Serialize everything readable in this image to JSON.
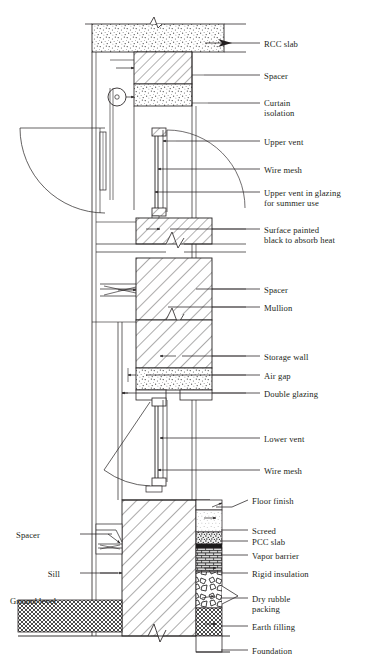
{
  "drawing": {
    "title": "Trombe wall vertical section detail",
    "type": "architectural-section",
    "line_color": "#231f20",
    "background": "#ffffff"
  },
  "labels_right": [
    {
      "id": "rcc-slab",
      "text": "RCC slab",
      "x": 264,
      "y": 39,
      "leader_from_x": 232,
      "leader_from_y": 43,
      "leader_to_x": 260,
      "leader_to_y": 43,
      "lines": 1
    },
    {
      "id": "spacer-top",
      "text": "Spacer",
      "x": 264,
      "y": 71,
      "leader_from_x": 204,
      "leader_from_y": 75,
      "leader_to_x": 260,
      "leader_to_y": 75,
      "lines": 1
    },
    {
      "id": "curtain-isolation",
      "text": "Curtain\nisolation",
      "x": 264,
      "y": 98,
      "leader_from_x": 208,
      "leader_from_y": 103,
      "leader_to_x": 260,
      "leader_to_y": 103,
      "lines": 2
    },
    {
      "id": "upper-vent",
      "text": "Upper vent",
      "x": 264,
      "y": 137,
      "leader_from_x": 176,
      "leader_from_y": 141,
      "leader_to_x": 260,
      "leader_to_y": 141,
      "lines": 1
    },
    {
      "id": "wire-mesh-upper",
      "text": "Wire mesh",
      "x": 264,
      "y": 165,
      "leader_from_x": 168,
      "leader_from_y": 169,
      "leader_to_x": 260,
      "leader_to_y": 169,
      "lines": 1
    },
    {
      "id": "upper-vent-glazing",
      "text": "Upper vent in glazing\nfor summer use",
      "x": 264,
      "y": 188,
      "leader_from_x": 160,
      "leader_from_y": 192,
      "leader_to_x": 260,
      "leader_to_y": 192,
      "lines": 2
    },
    {
      "id": "surface-painted",
      "text": "Surface painted\nblack to absorb heat",
      "x": 264,
      "y": 225,
      "leader_from_x": 170,
      "leader_from_y": 229,
      "leader_to_x": 260,
      "leader_to_y": 229,
      "lines": 2
    },
    {
      "id": "spacer-mid",
      "text": "Spacer",
      "x": 264,
      "y": 285,
      "leader_from_x": 196,
      "leader_from_y": 289,
      "leader_to_x": 260,
      "leader_to_y": 289,
      "lines": 1
    },
    {
      "id": "mullion",
      "text": "Mullion",
      "x": 264,
      "y": 303,
      "leader_from_x": 168,
      "leader_from_y": 307,
      "leader_to_x": 260,
      "leader_to_y": 307,
      "lines": 1
    },
    {
      "id": "storage-wall",
      "text": "Storage wall",
      "x": 264,
      "y": 352,
      "leader_from_x": 182,
      "leader_from_y": 356,
      "leader_to_x": 260,
      "leader_to_y": 356,
      "lines": 1
    },
    {
      "id": "air-gap",
      "text": "Air gap",
      "x": 264,
      "y": 371,
      "leader_from_x": 146,
      "leader_from_y": 375,
      "leader_to_x": 260,
      "leader_to_y": 375,
      "lines": 1
    },
    {
      "id": "double-glazing",
      "text": "Double glazing",
      "x": 264,
      "y": 389,
      "leader_from_x": 122,
      "leader_from_y": 393,
      "leader_to_x": 260,
      "leader_to_y": 393,
      "lines": 1
    },
    {
      "id": "lower-vent",
      "text": "Lower vent",
      "x": 264,
      "y": 434,
      "leader_from_x": 170,
      "leader_from_y": 438,
      "leader_to_x": 260,
      "leader_to_y": 438,
      "lines": 1
    },
    {
      "id": "wire-mesh-lower",
      "text": "Wire mesh",
      "x": 264,
      "y": 466,
      "leader_from_x": 168,
      "leader_from_y": 470,
      "leader_to_x": 260,
      "leader_to_y": 470,
      "lines": 1
    },
    {
      "id": "floor-finish",
      "text": "Floor finish",
      "x": 252,
      "y": 496,
      "leader_from_x": 216,
      "leader_from_y": 507,
      "leader_to_x": 248,
      "leader_to_y": 500,
      "lines": 1
    },
    {
      "id": "screed",
      "text": "Screed",
      "x": 252,
      "y": 526,
      "leader_from_x": 221,
      "leader_from_y": 530,
      "leader_to_x": 248,
      "leader_to_y": 530,
      "lines": 1
    },
    {
      "id": "pcc-slab",
      "text": "PCC slab",
      "x": 252,
      "y": 537,
      "leader_from_x": 221,
      "leader_from_y": 541,
      "leader_to_x": 248,
      "leader_to_y": 541,
      "lines": 1
    },
    {
      "id": "vapor-barrier",
      "text": "Vapor barrier",
      "x": 252,
      "y": 551,
      "leader_from_x": 221,
      "leader_from_y": 555,
      "leader_to_x": 248,
      "leader_to_y": 555,
      "lines": 1
    },
    {
      "id": "rigid-insulation",
      "text": "Rigid insulation",
      "x": 252,
      "y": 569,
      "leader_from_x": 221,
      "leader_from_y": 573,
      "leader_to_x": 248,
      "leader_to_y": 573,
      "lines": 1
    },
    {
      "id": "dry-rubble-packing",
      "text": "Dry rubble\npacking",
      "x": 252,
      "y": 594,
      "leader_from_x": 221,
      "leader_from_y": 598,
      "leader_to_x": 248,
      "leader_to_y": 598,
      "lines": 2
    },
    {
      "id": "earth-filling",
      "text": "Earth filling",
      "x": 252,
      "y": 622,
      "leader_from_x": 221,
      "leader_from_y": 626,
      "leader_to_x": 248,
      "leader_to_y": 626,
      "lines": 1
    },
    {
      "id": "foundation",
      "text": "Foundation",
      "x": 252,
      "y": 646,
      "leader_from_x": 221,
      "leader_from_y": 650,
      "leader_to_x": 248,
      "leader_to_y": 650,
      "lines": 1
    }
  ],
  "labels_left": [
    {
      "id": "spacer-sill",
      "text": "Spacer",
      "x": 40,
      "y": 530,
      "leader_from_x": 80,
      "leader_from_y": 534,
      "leader_to_x": 112,
      "leader_to_y": 534,
      "align": "right"
    },
    {
      "id": "sill",
      "text": "Sill",
      "x": 60,
      "y": 569,
      "leader_from_x": 80,
      "leader_from_y": 573,
      "leader_to_x": 118,
      "leader_to_y": 573,
      "align": "right"
    },
    {
      "id": "ground-level",
      "text": "Ground level",
      "x": 10,
      "y": 596,
      "leader_from_x": 0,
      "leader_from_y": 0,
      "leader_to_x": 0,
      "leader_to_y": 0,
      "align": "left"
    }
  ],
  "materials": {
    "rcc_slab": "concrete-speckle",
    "spacer": "diagonal-hatch",
    "curtain_isolation": "concrete-speckle",
    "storage_wall": "diagonal-hatch",
    "air_gap": "void",
    "double_glazing": "thin-double-line",
    "screed": "light-speckle",
    "pcc_slab": "dense-aggregate",
    "vapor_barrier": "solid-dark",
    "rigid_insulation": "brick-hatch",
    "dry_rubble_packing": "irregular-stone",
    "earth_filling": "cross-hatch",
    "ground_level": "cross-hatch",
    "foundation": "diagonal-hatch"
  }
}
